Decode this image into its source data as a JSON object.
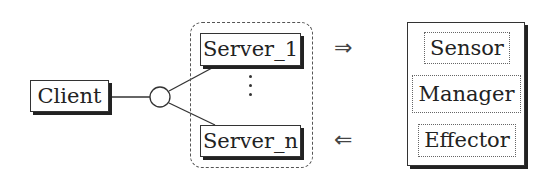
{
  "diagram": {
    "type": "client-server architecture with autonomic manager",
    "client": {
      "label": "Client"
    },
    "interface": {
      "symbol": "circle-connector"
    },
    "server_group": {
      "style": "dashed-rounded",
      "servers": [
        {
          "label": "Server_1"
        },
        {
          "label": "Server_n"
        }
      ],
      "ellipsis": "vertical-dots"
    },
    "arrows": [
      {
        "symbol": "⇒",
        "direction": "right",
        "from": "Server group",
        "to": "Sensor"
      },
      {
        "symbol": "⇐",
        "direction": "left",
        "from": "Effector",
        "to": "Server group"
      }
    ],
    "manager_block": {
      "components": [
        {
          "label": "Sensor"
        },
        {
          "label": "Manager"
        },
        {
          "label": "Effector"
        }
      ]
    },
    "colors": {
      "stroke": "#333333",
      "shadow": "#222222",
      "background": "#ffffff"
    }
  }
}
